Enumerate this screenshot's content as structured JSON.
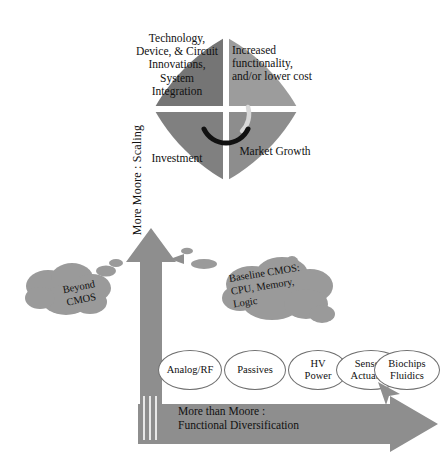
{
  "diagram": {
    "colors": {
      "quad_top_left": "#757575",
      "quad_top_right": "#9c9c9c",
      "quad_bottom_left": "#808080",
      "quad_bottom_right": "#8d8d8d",
      "arrow_gray": "#8e8e8e",
      "cloud_gray": "#9a9a9a",
      "ellipse_outline": "#6f6f6f",
      "background": "#ffffff"
    }
  },
  "wheel": {
    "name": "virtuous-cycle",
    "center_icon": "circular-arrows-icon",
    "quadrants": [
      {
        "id": "top-left",
        "label": "Technology, Device, & Circuit Innovations, System Integration"
      },
      {
        "id": "top-right",
        "label": "Increased functionality, and/or lower cost"
      },
      {
        "id": "bottom-left",
        "label": "Investment"
      },
      {
        "id": "bottom-right",
        "label": "Market Growth"
      }
    ]
  },
  "axes": {
    "vertical": {
      "label": "More Moore : Scaling",
      "icon": "up-arrow-icon"
    },
    "horizontal": {
      "label": "More than Moore :\nFunctional Diversification",
      "line1": "More than Moore :",
      "line2": "Functional Diversification",
      "icon": "right-arrow-icon"
    }
  },
  "clouds": [
    {
      "id": "beyond-cmos",
      "label": "Beyond CMOS",
      "line1": "Beyond",
      "line2": "CMOS"
    },
    {
      "id": "baseline-cmos",
      "label": "Baseline CMOS: CPU, Memory, Logic",
      "line1": "Baseline CMOS:",
      "line2": "CPU, Memory,",
      "line3": "Logic"
    }
  ],
  "applications": [
    {
      "id": "analog-rf",
      "line1": "Analog/RF",
      "line2": ""
    },
    {
      "id": "passives",
      "line1": "Passives",
      "line2": ""
    },
    {
      "id": "hv-power",
      "line1": "HV",
      "line2": "Power"
    },
    {
      "id": "sensors-actuators",
      "line1": "Sensors",
      "line2": "Actuators"
    },
    {
      "id": "biochips-fluidics",
      "line1": "Biochips",
      "line2": "Fluidics"
    }
  ]
}
